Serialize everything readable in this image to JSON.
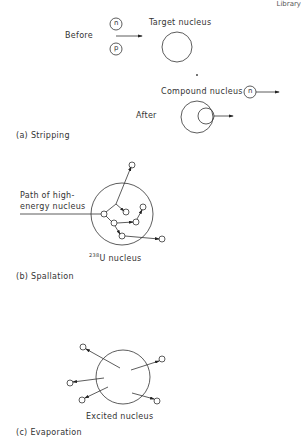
{
  "header_fragment": "Library",
  "panel_a": {
    "caption": "(a) Stripping",
    "before_label": "Before",
    "target_label": "Target nucleus",
    "neutron_label": "n",
    "proton_label": "p",
    "after_label": "After",
    "compound_label": "Compound nucleus",
    "emitted_neutron_label": "n"
  },
  "panel_b": {
    "caption": "(b) Spallation",
    "path_label_line1": "Path of high-",
    "path_label_line2": "energy nucleus",
    "nucleus_mass": "238",
    "nucleus_label": "U nucleus"
  },
  "panel_c": {
    "caption": "(c) Evaporation",
    "nucleus_label": "Excited nucleus"
  }
}
